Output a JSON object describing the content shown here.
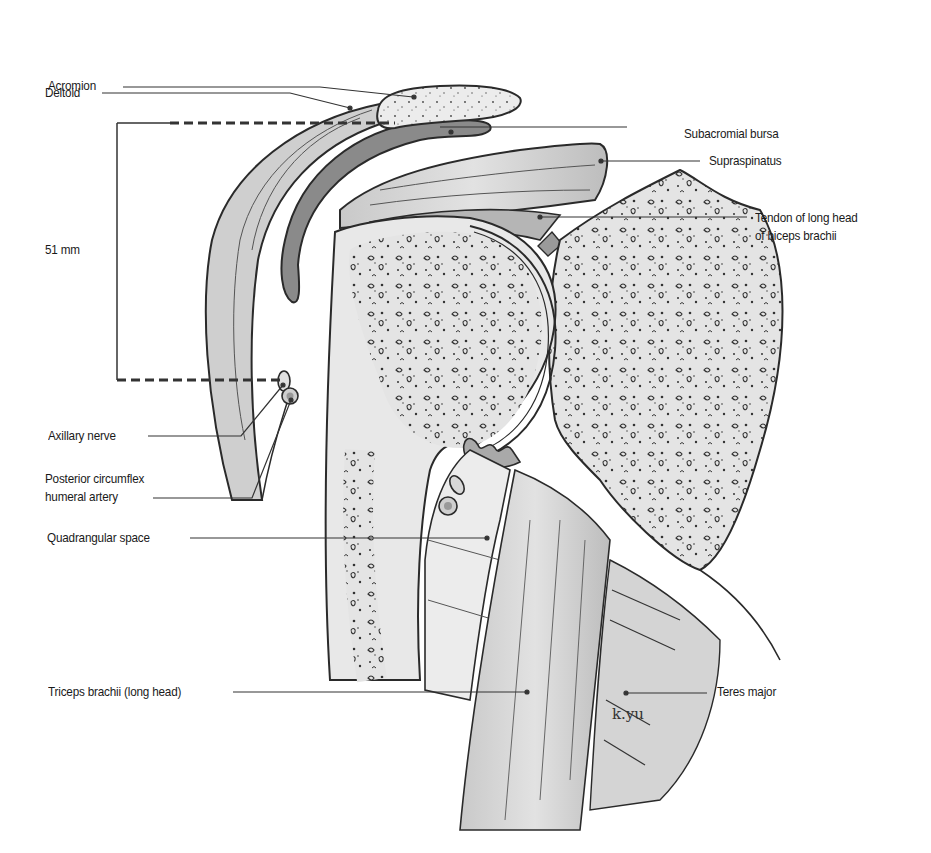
{
  "figure": {
    "measurement": "51 mm",
    "signature": "k.yu"
  },
  "labels_left": [
    {
      "id": "acromion",
      "text": "Acromion"
    },
    {
      "id": "deltoid",
      "text": "Deltoid"
    },
    {
      "id": "axillary-nerve",
      "text": "Axillary nerve"
    },
    {
      "id": "posterior-circumflex-humeral-artery",
      "text": "Posterior circumflex\nhumeral artery"
    },
    {
      "id": "quadrangular-space",
      "text": "Quadrangular space"
    },
    {
      "id": "triceps-brachii",
      "text": "Triceps brachii (long head)"
    }
  ],
  "labels_right": [
    {
      "id": "subacromial-bursa",
      "text": "Subacromial bursa"
    },
    {
      "id": "supraspinatus",
      "text": "Supraspinatus"
    },
    {
      "id": "biceps-tendon",
      "text": "Tendon of long head\nof biceps brachii"
    },
    {
      "id": "teres-major",
      "text": "Teres major"
    }
  ],
  "colors": {
    "outline": "#2a2a2a",
    "muscle_fill": "#bdbdbd",
    "muscle_light": "#d9d9d9",
    "bone_fill": "#e6e6e6",
    "bursa_dark": "#6a6a6a",
    "leader": "#333333"
  }
}
